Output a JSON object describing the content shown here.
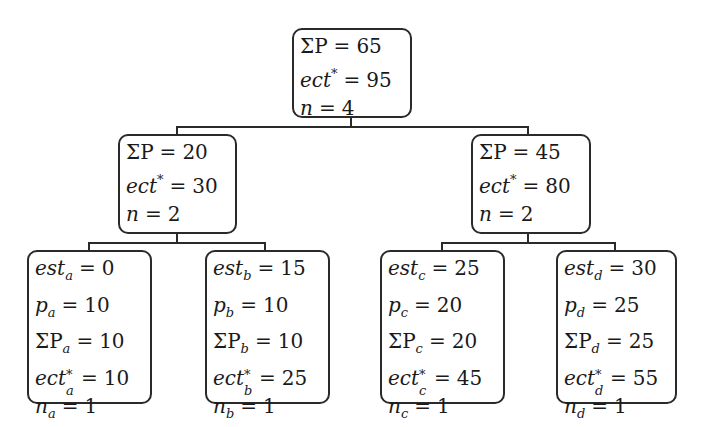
{
  "diagram": {
    "type": "tree",
    "root": {
      "id": "root",
      "lines": [
        {
          "label": "ΣP",
          "sub": "",
          "sup": "",
          "value": "65"
        },
        {
          "label": "ect",
          "sub": "",
          "sup": "*",
          "value": "95"
        },
        {
          "label": "n",
          "sub": "",
          "sup": "",
          "value": "4"
        }
      ]
    },
    "level1": [
      {
        "id": "left",
        "lines": [
          {
            "label": "ΣP",
            "sub": "",
            "sup": "",
            "value": "20"
          },
          {
            "label": "ect",
            "sub": "",
            "sup": "*",
            "value": "30"
          },
          {
            "label": "n",
            "sub": "",
            "sup": "",
            "value": "2"
          }
        ]
      },
      {
        "id": "right",
        "lines": [
          {
            "label": "ΣP",
            "sub": "",
            "sup": "",
            "value": "45"
          },
          {
            "label": "ect",
            "sub": "",
            "sup": "*",
            "value": "80"
          },
          {
            "label": "n",
            "sub": "",
            "sup": "",
            "value": "2"
          }
        ]
      }
    ],
    "leaves": [
      {
        "id": "a",
        "lines": [
          {
            "label": "est",
            "sub": "a",
            "sup": "",
            "value": "0"
          },
          {
            "label": "p",
            "sub": "a",
            "sup": "",
            "value": "10"
          },
          {
            "label": "ΣP",
            "sub": "a",
            "sup": "",
            "value": "10"
          },
          {
            "label": "ect",
            "sub": "a",
            "sup": "*",
            "value": "10"
          },
          {
            "label": "n",
            "sub": "a",
            "sup": "",
            "value": "1"
          }
        ]
      },
      {
        "id": "b",
        "lines": [
          {
            "label": "est",
            "sub": "b",
            "sup": "",
            "value": "15"
          },
          {
            "label": "p",
            "sub": "b",
            "sup": "",
            "value": "10"
          },
          {
            "label": "ΣP",
            "sub": "b",
            "sup": "",
            "value": "10"
          },
          {
            "label": "ect",
            "sub": "b",
            "sup": "*",
            "value": "25"
          },
          {
            "label": "n",
            "sub": "b",
            "sup": "",
            "value": "1"
          }
        ]
      },
      {
        "id": "c",
        "lines": [
          {
            "label": "est",
            "sub": "c",
            "sup": "",
            "value": "25"
          },
          {
            "label": "p",
            "sub": "c",
            "sup": "",
            "value": "20"
          },
          {
            "label": "ΣP",
            "sub": "c",
            "sup": "",
            "value": "20"
          },
          {
            "label": "ect",
            "sub": "c",
            "sup": "*",
            "value": "45"
          },
          {
            "label": "n",
            "sub": "c",
            "sup": "",
            "value": "1"
          }
        ]
      },
      {
        "id": "d",
        "lines": [
          {
            "label": "est",
            "sub": "d",
            "sup": "",
            "value": "30"
          },
          {
            "label": "p",
            "sub": "d",
            "sup": "",
            "value": "25"
          },
          {
            "label": "ΣP",
            "sub": "d",
            "sup": "",
            "value": "25"
          },
          {
            "label": "ect",
            "sub": "d",
            "sup": "*",
            "value": "55"
          },
          {
            "label": "n",
            "sub": "d",
            "sup": "",
            "value": "1"
          }
        ]
      }
    ],
    "edges": [
      [
        "root",
        "left"
      ],
      [
        "root",
        "right"
      ],
      [
        "left",
        "a"
      ],
      [
        "left",
        "b"
      ],
      [
        "right",
        "c"
      ],
      [
        "right",
        "d"
      ]
    ],
    "colors": {
      "stroke": "#2a2a2a",
      "background": "#ffffff",
      "text": "#1a1a1a"
    },
    "equals": "="
  }
}
